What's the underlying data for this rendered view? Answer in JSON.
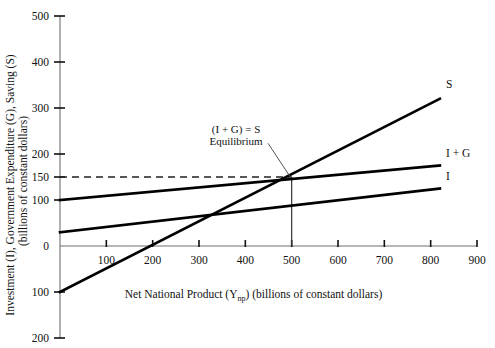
{
  "chart_data": {
    "type": "line",
    "title": "",
    "xlabel": "Net National Product (Ynp)  (billions of constant dollars)",
    "xlabel_main": "Net National Product (Y",
    "xlabel_sub": "np",
    "xlabel_tail": ")  (billions of constant dollars)",
    "ylabel": "Investment (I), Government Expenditure (G), Saving (S)",
    "ylabel_line2": "(billions of constant dollars)",
    "xlim": [
      0,
      900
    ],
    "ylim": [
      -200,
      500
    ],
    "xticks": [
      100,
      200,
      300,
      400,
      500,
      600,
      700,
      800,
      900
    ],
    "xticklabels": [
      "100",
      "200",
      "300",
      "400",
      "500",
      "600",
      "700",
      "800",
      "900"
    ],
    "yticks": [
      500,
      400,
      300,
      200,
      150,
      100,
      0,
      -100,
      -200
    ],
    "yticklabels": [
      "500",
      "400",
      "300",
      "200",
      "150",
      "100",
      "0",
      "100",
      "200"
    ],
    "grid": false,
    "legend_position": "inline-right",
    "series": [
      {
        "name": "S",
        "label": "S",
        "points": [
          [
            0,
            -100
          ],
          [
            820,
            320
          ]
        ],
        "slope": 0.512,
        "intercept": -100
      },
      {
        "name": "I + G",
        "label": "I + G",
        "points": [
          [
            0,
            100
          ],
          [
            820,
            175
          ]
        ],
        "slope": 0.0915,
        "intercept": 100
      },
      {
        "name": "I",
        "label": "I",
        "points": [
          [
            0,
            30
          ],
          [
            820,
            125
          ]
        ],
        "slope": 0.116,
        "intercept": 30
      }
    ],
    "annotations": [
      {
        "name": "equilibrium",
        "line1": "(I + G) = S",
        "line2": "Equilibrium",
        "point": [
          500,
          150
        ],
        "text_x": 380,
        "text_y": 245
      }
    ],
    "reference_lines": [
      {
        "name": "equilibrium-horizontal",
        "style": "dashed",
        "y": 150,
        "x_from": 0,
        "x_to": 500
      },
      {
        "name": "equilibrium-vertical",
        "style": "solid",
        "x": 500,
        "y_from": 0,
        "y_to": 150
      }
    ]
  },
  "colors": {
    "curve": "#000000",
    "axis": "#6f6f6f",
    "text": "#111111",
    "background": "#ffffff"
  }
}
